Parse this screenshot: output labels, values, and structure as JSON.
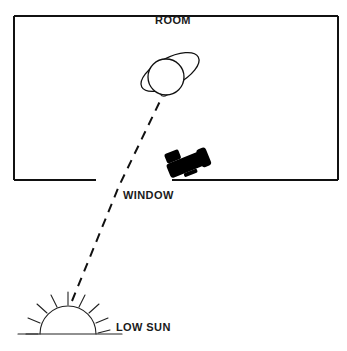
{
  "figure": {
    "title": "",
    "type": "line-art schematic diagram",
    "background_color": "#ffffff",
    "ink_color": "#111111",
    "width": 347,
    "height": 351
  },
  "labels": {
    "room": "ROOM",
    "window": "WINDOW",
    "low_sun": "LOW SUN"
  },
  "elements": {
    "room": {
      "name": "room",
      "shape": "rectangle-with-gap",
      "label": "ROOM",
      "label_position": "top-center-inside",
      "bounds": {
        "x": 14,
        "y": 16,
        "width": 324,
        "height": 164
      },
      "wall_gap": {
        "side": "bottom",
        "from_x": 96,
        "to_x": 172,
        "meaning": "window opening"
      }
    },
    "person": {
      "name": "person-head-with-hat",
      "head": {
        "shape": "circle",
        "cx": 166,
        "cy": 77,
        "r": 18
      },
      "hat_brim": {
        "shape": "ellipse",
        "cx": 170,
        "cy": 72,
        "rx": 32,
        "ry": 14,
        "rotation_deg": -28
      }
    },
    "camera": {
      "name": "camera",
      "shape": "filled-silhouette",
      "fill": "#000000",
      "position": {
        "x": 168,
        "y": 150
      },
      "rotation_deg": -22,
      "parts": [
        "body",
        "viewfinder",
        "lens-hood"
      ]
    },
    "sun": {
      "name": "low-sun",
      "label": "LOW SUN",
      "shape": "semicircle-on-horizon",
      "center": {
        "cx": 68,
        "cy": 333
      },
      "radius": 28,
      "ray_count": 9,
      "horizon_line": {
        "x1": 18,
        "x2": 122,
        "y": 333
      }
    },
    "light_ray": {
      "name": "sunlight-ray",
      "style": "dashed",
      "from": "LOW SUN",
      "through": "WINDOW",
      "to": "person head",
      "points": [
        {
          "x": 72,
          "y": 301
        },
        {
          "x": 119,
          "y": 186
        },
        {
          "x": 162,
          "y": 97
        }
      ]
    }
  },
  "sun_rays": [
    {
      "angle_deg": 180,
      "inner": 30,
      "outer": 42
    },
    {
      "angle_deg": 202,
      "inner": 30,
      "outer": 42
    },
    {
      "angle_deg": 224,
      "inner": 30,
      "outer": 42
    },
    {
      "angle_deg": 246,
      "inner": 30,
      "outer": 42
    },
    {
      "angle_deg": 268,
      "inner": 30,
      "outer": 42
    },
    {
      "angle_deg": 290,
      "inner": 30,
      "outer": 42
    },
    {
      "angle_deg": 312,
      "inner": 30,
      "outer": 42
    },
    {
      "angle_deg": 334,
      "inner": 30,
      "outer": 42
    },
    {
      "angle_deg": 356,
      "inner": 30,
      "outer": 42
    }
  ]
}
